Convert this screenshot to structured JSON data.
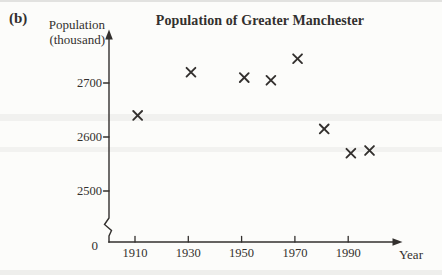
{
  "figure_label": "(b)",
  "title": "Population of Greater Manchester",
  "y_axis": {
    "label_line1": "Population",
    "label_line2": "(thousand)",
    "origin_label": "0",
    "has_axis_break": true
  },
  "x_axis": {
    "label": "Year"
  },
  "colors": {
    "ink": "#33302e",
    "background": "#fcfcfa"
  },
  "chart_data": {
    "type": "scatter",
    "title": "Population of Greater Manchester",
    "xlabel": "Year",
    "ylabel": "Population (thousand)",
    "marker": "x",
    "grid": false,
    "legend": "none",
    "x_ticks": [
      1910,
      1930,
      1950,
      1970,
      1990
    ],
    "y_ticks": [
      2700,
      2600,
      2500
    ],
    "y_axis_break_to_zero": true,
    "xlim": [
      1910,
      2008
    ],
    "ylim_shown": [
      2500,
      2760
    ],
    "points": [
      {
        "year": 1911,
        "population_thousand": 2640
      },
      {
        "year": 1931,
        "population_thousand": 2720
      },
      {
        "year": 1951,
        "population_thousand": 2710
      },
      {
        "year": 1961,
        "population_thousand": 2705
      },
      {
        "year": 1971,
        "population_thousand": 2745
      },
      {
        "year": 1981,
        "population_thousand": 2615
      },
      {
        "year": 1991,
        "population_thousand": 2570
      },
      {
        "year": 1998,
        "population_thousand": 2575
      }
    ]
  }
}
